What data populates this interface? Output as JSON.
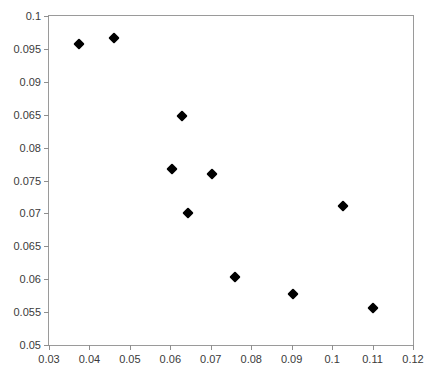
{
  "chart_data": {
    "type": "scatter",
    "title": "",
    "xlabel": "",
    "ylabel": "",
    "xlim": [
      0.03,
      0.12
    ],
    "ylim": [
      0.05,
      0.1
    ],
    "grid": false,
    "legend": "none",
    "marker_style": "filled-diamond",
    "marker_color": "#000000",
    "frame_color": "#9a9a9a",
    "xticks": [
      "0.03",
      "0.04",
      "0.05",
      "0.06",
      "0.07",
      "0.08",
      "0.09",
      "0.1",
      "0.11",
      "0.12"
    ],
    "xtick_values": [
      0.03,
      0.04,
      0.05,
      0.06,
      0.07,
      0.08,
      0.09,
      0.1,
      0.11,
      0.12
    ],
    "yticks": [
      "0.1",
      "0.095",
      "0.09",
      "0.065",
      "0.08",
      "0.075",
      "0.07",
      "0.065",
      "0.06",
      "0.055",
      "0.05"
    ],
    "ytick_values": [
      0.1,
      0.095,
      0.09,
      0.085,
      0.08,
      0.075,
      0.07,
      0.065,
      0.06,
      0.055,
      0.05
    ],
    "x": [
      0.0375,
      0.0461,
      0.063,
      0.0605,
      0.0703,
      0.0644,
      0.1028,
      0.076,
      0.0904,
      0.1101
    ],
    "y": [
      0.0958,
      0.0967,
      0.0848,
      0.0768,
      0.076,
      0.0701,
      0.0712,
      0.0603,
      0.0577,
      0.0556
    ],
    "points": [
      {
        "x": 0.0375,
        "y": 0.0958
      },
      {
        "x": 0.0461,
        "y": 0.0967
      },
      {
        "x": 0.063,
        "y": 0.0848
      },
      {
        "x": 0.0605,
        "y": 0.0768
      },
      {
        "x": 0.0703,
        "y": 0.076
      },
      {
        "x": 0.0644,
        "y": 0.0701
      },
      {
        "x": 0.1028,
        "y": 0.0712
      },
      {
        "x": 0.076,
        "y": 0.0603
      },
      {
        "x": 0.0904,
        "y": 0.0577
      },
      {
        "x": 0.1101,
        "y": 0.0556
      }
    ]
  }
}
